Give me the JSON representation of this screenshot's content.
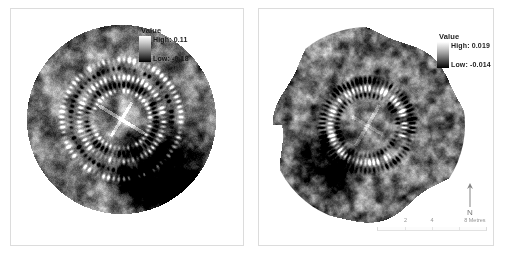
{
  "figure": {
    "title": "",
    "panels": [
      {
        "id": "left",
        "name": "survey-plot-left",
        "legend": {
          "title": "Value",
          "high_label": "High: 0.11",
          "low_label": "Low: -0.18",
          "high_value": 0.11,
          "low_value": -0.18,
          "ramp_high_color": "#ffffff",
          "ramp_low_color": "#000000"
        }
      },
      {
        "id": "right",
        "name": "survey-plot-right",
        "legend": {
          "title": "Value",
          "high_label": "High: 0.019",
          "low_label": "Low: -0.014",
          "high_value": 0.019,
          "low_value": -0.014,
          "ramp_high_color": "#ffffff",
          "ramp_low_color": "#000000"
        },
        "north_arrow": {
          "label": "N"
        },
        "scale_bar": {
          "ticks": [
            "0",
            "2",
            "4"
          ],
          "end_label": "8 Metres",
          "units": "Metres",
          "max": 8
        }
      }
    ]
  },
  "chart_data": {
    "type": "heatmap",
    "title": "",
    "subtitle": "",
    "xlabel": "",
    "ylabel": "",
    "legend_position": "top-right",
    "grid": false,
    "panels": [
      {
        "name": "Left survey - greyscale geophysical plot",
        "shape": "circular",
        "colormap": "greyscale-inverted",
        "vmin": -0.18,
        "vmax": 0.11,
        "legend_title": "Value",
        "high_label": "High: 0.11",
        "low_label": "Low: -0.18",
        "features": [
          "circular survey footprint",
          "outer ring of discrete high-value anomalies",
          "inner ring of discrete anomalies",
          "central enclosure with linear features",
          "broad dark low-value zone lower-right"
        ]
      },
      {
        "name": "Right survey - greyscale geophysical plot",
        "shape": "irregular-circular",
        "colormap": "greyscale-inverted",
        "vmin": -0.014,
        "vmax": 0.019,
        "legend_title": "Value",
        "high_label": "High: 0.019",
        "low_label": "Low: -0.014",
        "scale_bar_ticks": [
          0,
          2,
          4
        ],
        "scale_bar_max": 8,
        "scale_bar_units": "Metres",
        "north_arrow": "N",
        "features": [
          "irregular circular survey footprint",
          "bright high-value ring (inner)",
          "dark low-value ring (outer)",
          "mottled background response",
          "radial break at lower-right of ring"
        ]
      }
    ]
  }
}
